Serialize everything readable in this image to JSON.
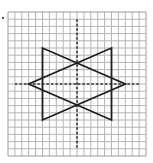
{
  "diagram": {
    "type": "grid-figure",
    "grid": {
      "columns": 20,
      "rows": 20,
      "origin_px": [
        8,
        12
      ],
      "size_px": [
        138,
        144
      ],
      "line_color": "#b4b4b4",
      "border_color": "#9a9a9a"
    },
    "axes": {
      "style": "dashed",
      "color": "#333333",
      "center_cell": [
        10,
        10
      ],
      "horizontal": {
        "row": 10,
        "from_col": 1,
        "to_col": 19
      },
      "vertical": {
        "col": 10,
        "from_row": 1,
        "to_row": 19
      }
    },
    "shapes": [
      {
        "name": "right-pointing-triangle",
        "stroke": "#1e1e1e",
        "vertices": [
          [
            5,
            5
          ],
          [
            5,
            15
          ],
          [
            17,
            10
          ]
        ]
      },
      {
        "name": "left-pointing-triangle",
        "stroke": "#1e1e1e",
        "vertices": [
          [
            15,
            5
          ],
          [
            15,
            15
          ],
          [
            3,
            10
          ]
        ]
      }
    ],
    "intersections_on_axis": [
      [
        10,
        7.08
      ],
      [
        10,
        12.92
      ]
    ]
  }
}
